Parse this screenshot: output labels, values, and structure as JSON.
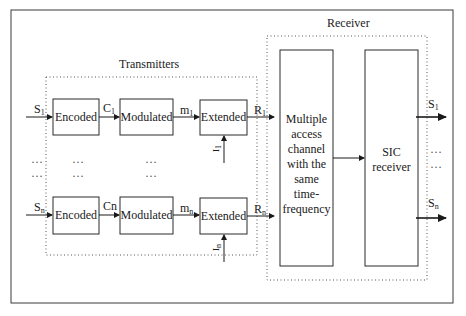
{
  "colors": {
    "stroke": "#2a2a2a",
    "dotted": "#555555",
    "background": "#ffffff"
  },
  "transmitters": {
    "title": "Transmitters",
    "rows": [
      {
        "input": {
          "base": "S",
          "sub": "1"
        },
        "blocks": [
          "Encoded",
          "Modulated",
          "Extended"
        ],
        "links": [
          {
            "base": "C",
            "sub": "1"
          },
          {
            "base": "m",
            "sub": "1"
          }
        ],
        "side_input": {
          "base": "I",
          "sub": "1"
        },
        "output": {
          "base": "R",
          "sub": "1"
        }
      },
      {
        "input": {
          "base": "S",
          "sub": "n"
        },
        "blocks": [
          "Encoded",
          "Modulated",
          "Extended"
        ],
        "links": [
          {
            "base": "Cn",
            "sub": ""
          },
          {
            "base": "m",
            "sub": "n"
          }
        ],
        "side_input": {
          "base": "I",
          "sub": "n"
        },
        "output": {
          "base": "R",
          "sub": "n"
        }
      }
    ],
    "ellipsis": "…"
  },
  "receiver": {
    "title": "Receiver",
    "channel_block": "Multiple access channel with the same time-frequency",
    "channel_lines": [
      "Multiple",
      "access",
      "channel",
      "with the",
      "same",
      "time-",
      "frequency"
    ],
    "sic_block_lines": [
      "SIC",
      "receiver"
    ],
    "outputs": [
      {
        "base": "S",
        "sub": "1"
      },
      {
        "base": "S",
        "sub": "n"
      }
    ],
    "ellipsis": "…"
  }
}
